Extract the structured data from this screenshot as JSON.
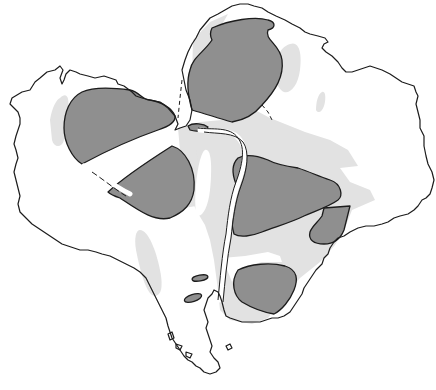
{
  "map": {
    "title": "",
    "subject": "distorted outline of South America with shaded zones",
    "colors": {
      "background": "#ffffff",
      "land": "#ffffff",
      "outline": "#1c1c1c",
      "light_zone": "#e2e2e2",
      "dark_zone": "#8f8f8f"
    },
    "legend": [],
    "labels": [],
    "zones": {
      "dark": [
        "northwest-lobe-upper",
        "northwest-lobe-lower",
        "north-lobe",
        "central-east",
        "east-small",
        "southeast",
        "isthmus-small",
        "patagonia-spot-1",
        "patagonia-spot-2"
      ],
      "light": [
        "central-band",
        "west-andes-strip",
        "patagonia-strip",
        "northwest-strip",
        "north-east-patch",
        "north-small-patch"
      ]
    }
  }
}
